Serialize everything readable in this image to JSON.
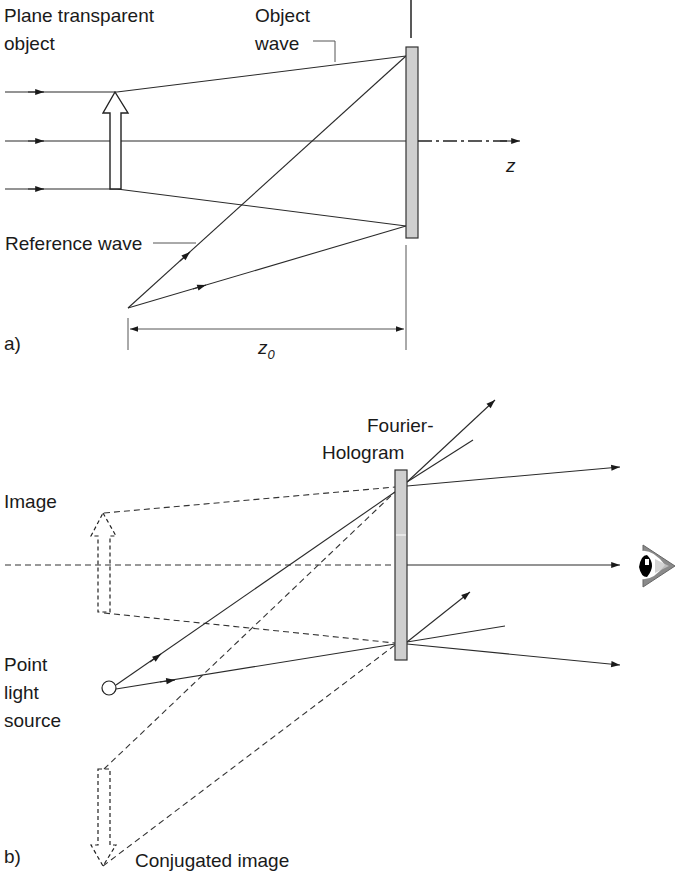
{
  "figure": {
    "panel_a": {
      "tag": "a)",
      "labels": {
        "plane_object_line1": "Plane transparent",
        "plane_object_line2": "object",
        "object_wave_line1": "Object",
        "object_wave_line2": "wave",
        "reference_wave": "Reference wave",
        "axis": "z",
        "distance": "z",
        "distance_sub": "0"
      }
    },
    "panel_b": {
      "tag": "b)",
      "labels": {
        "hologram_line1": "Fourier-",
        "hologram_line2": "Hologram",
        "image": "Image",
        "point_source_line1": "Point",
        "point_source_line2": "light",
        "point_source_line3": "source",
        "conjugated_image": "Conjugated image"
      }
    },
    "colors": {
      "line": "#2a2a2a",
      "hologram_fill": "#cfcfcf",
      "background": "#ffffff"
    }
  }
}
